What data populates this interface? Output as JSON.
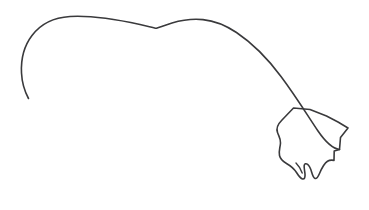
{
  "canvas": {
    "width": 369,
    "height": 210,
    "background_color": "#ffffff",
    "title": "Minimalist line drawing of an animal back contour ending in a paw"
  },
  "style": {
    "ink_color": "#3a3a3c",
    "stroke_width": 1.6,
    "stroke_width_thin": 1.4,
    "fill": "none"
  },
  "strokes": [
    {
      "name": "tail-and-back-contour",
      "description": "Long sweeping curve: starts as a thin curled tail tip at lower left, rises up and arcs over the back with a shallow notch, then descends steeply to the right into the paw",
      "path": "M 28.5 98.5 C 25.0 92.0 22.0 83.0 21.5 73.0 C 20.8 59.0 24.0 46.0 32.0 35.5 C 41.0 23.5 54.0 17.5 70.0 16.5 C 92.0 15.2 117.0 19.5 140.0 24.5 C 148.0 26.3 153.0 27.6 156.5 28.3 C 160.5 27.0 166.0 24.8 172.0 23.0 C 182.0 20.0 193.0 18.6 203.0 19.6 C 215.0 20.8 226.0 25.5 236.5 32.5 C 253.0 43.6 268.0 59.0 281.0 76.5 C 296.0 96.5 308.5 117.0 318.0 131.0 C 325.0 141.2 332.0 148.5 339.5 149.5"
    },
    {
      "name": "paw-outline",
      "description": "Angular paw / foot polygon with concave left edge, zigzag right edge and two rounded toe lobes at the bottom",
      "path": "M 293.5 108.0 L 282.0 120.0 C 277.5 124.5 276.0 128.5 277.5 132.5 C 279.0 136.5 280.8 139.0 280.5 143.0 C 280.2 147.5 278.5 151.0 279.5 155.5 C 280.3 159.0 283.0 161.5 286.5 163.5 C 290.5 165.8 294.0 168.5 296.5 172.5 C 298.5 175.7 300.5 178.5 302.6 179.0 C 304.5 179.4 305.3 177.2 305.0 174.0 C 304.7 170.8 303.8 167.5 304.2 165.5 C 304.6 163.8 306.0 163.2 307.6 164.4 C 309.4 165.7 310.5 168.2 311.6 172.0 C 312.6 175.5 313.6 178.0 315.1 178.5 C 316.7 179.0 318.0 177.0 319.5 173.5 C 321.6 168.6 324.5 163.2 327.5 161.3 C 329.8 159.8 332.0 160.0 334.0 160.4 L 334.2 151.0 L 339.5 149.5 L 340.5 137.5 L 348.0 128.0 L 338.0 122.0 L 326.5 116.0 L 310.0 109.5 Z"
    },
    {
      "name": "inner-toe-crease",
      "description": "Short inner crease line where the two front toe lobes meet",
      "path": "M 296.0 163.0 C 298.5 165.5 300.8 169.0 302.2 173.0"
    }
  ]
}
